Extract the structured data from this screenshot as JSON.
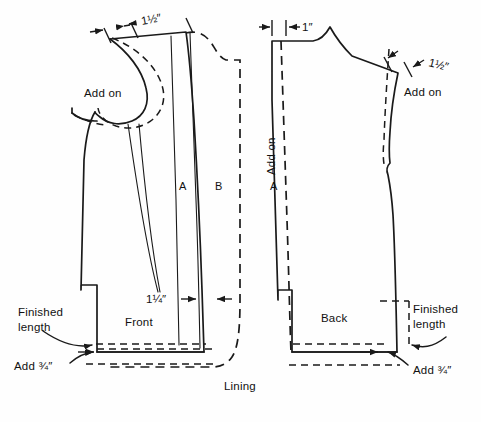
{
  "figure": {
    "title": "Lining",
    "background_color": "#fefefe",
    "ink_color": "#1a1a1a"
  },
  "pieces": {
    "front": {
      "name": "Front",
      "section_a": "A",
      "section_b": "B"
    },
    "back": {
      "name": "Back",
      "section_a": "A"
    }
  },
  "labels": {
    "add_on_front_shoulder": "Add on",
    "add_on_back_left": "Add on",
    "add_on_back_right": "Add on",
    "finished_length_front": "Finished\nlength",
    "finished_length_front_line1": "Finished",
    "finished_length_front_line2": "length",
    "finished_length_back_line1": "Finished",
    "finished_length_back_line2": "length",
    "add_hem_front": "Add ¾″",
    "add_hem_back": "Add ¾″"
  },
  "dimensions": {
    "front_shoulder": "1½″",
    "front_center": "1¼″",
    "back_shoulder": "1″",
    "back_armhole": "1½″"
  }
}
